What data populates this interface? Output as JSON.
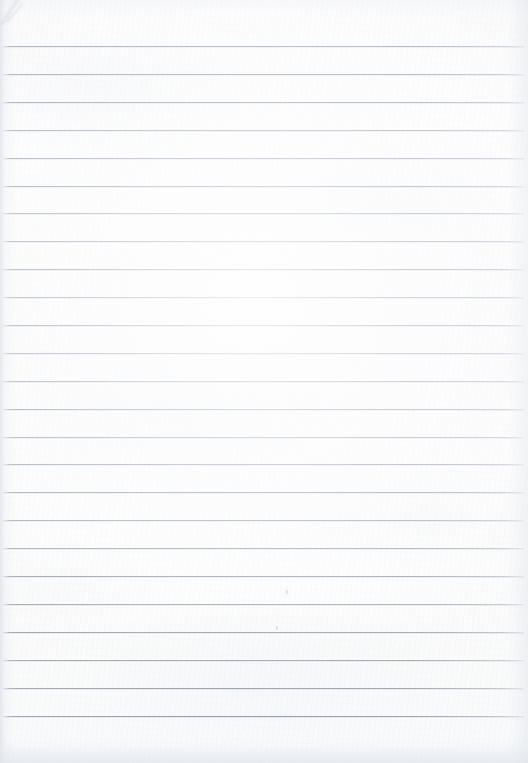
{
  "document": {
    "kind": "scanned-lined-paper",
    "title": "Blank ruled notebook page",
    "text_content": "",
    "page_width": 528,
    "page_height": 763
  },
  "paper": {
    "background_color": "#fbfbfc",
    "texture": "fibrous-laid-paper",
    "tint": "cool-neutral-white"
  },
  "ruling": {
    "line_color": "#888f9d",
    "line_thickness_px": 1,
    "line_count": 24,
    "first_line_y": 46,
    "line_spacing_px": 27.9,
    "last_line_y": 716,
    "line_start_x": 3,
    "line_end_x": 524,
    "top_margin_px": 46,
    "bottom_margin_px": 47,
    "has_vertical_margin_rule": false,
    "lines_y": [
      46,
      74,
      102,
      130,
      158,
      186,
      213,
      241,
      269,
      297,
      325,
      353,
      381,
      409,
      437,
      464,
      492,
      520,
      548,
      576,
      604,
      632,
      660,
      688,
      716
    ]
  },
  "artifacts": {
    "corner_crease": {
      "position": "top-left",
      "x": 0,
      "y": 0,
      "width": 34,
      "height": 30
    },
    "specks": [
      {
        "x": 286,
        "y": 590,
        "width": 2,
        "height": 4
      },
      {
        "x": 276,
        "y": 626,
        "width": 2,
        "height": 4
      }
    ]
  }
}
